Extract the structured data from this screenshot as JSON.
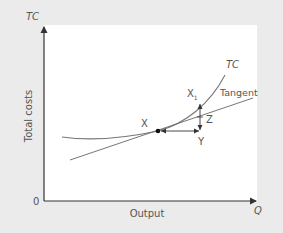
{
  "figure": {
    "y_axis_symbol": "TC",
    "y_axis_label": "Total costs",
    "x_axis_symbol": "Q",
    "x_axis_label": "Output",
    "origin_label": "0",
    "curve_label": "TC",
    "tangent_label": "Tangent",
    "points": {
      "x": "X",
      "x1": "X",
      "x1_subscript": "1",
      "z": "Z",
      "y": "Y"
    }
  },
  "colors": {
    "background": "#ebebeb",
    "panel": "#ffffff",
    "axis": "#333333",
    "curve": "#777777",
    "tangent": "#666666",
    "text": "#555555"
  }
}
